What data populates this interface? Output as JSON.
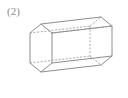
{
  "figure": {
    "label": "(2)",
    "shape_name": "hexagonal-prism",
    "projection": "oblique",
    "colors": {
      "background": "#ffffff",
      "visible_edge": "#8d8d8d",
      "hidden_edge": "#a9a9a9",
      "label_text": "#8a8a8a"
    },
    "geometry": {
      "front_hexagon": {
        "description": "near hexagonal face, left side of drawing",
        "points": "41,24 30,33 30,63 41,72 52,63 52,33"
      },
      "back_hexagon": {
        "description": "far hexagonal face, right side of drawing, offset up-right",
        "points": "101,17 90,26 90,56 101,65 112,56 112,26"
      },
      "connector_edges": [
        "41,24 101,17",
        "30,33 90,26",
        "30,63 90,56",
        "41,72 101,65",
        "52,63 112,56",
        "52,33 112,26"
      ],
      "visible_edges": [
        "30,33 41,24",
        "41,24 52,33",
        "30,33 30,63",
        "30,63 41,72",
        "41,72 52,63",
        "52,63 52,33",
        "41,24 101,17",
        "101,17 112,26",
        "112,26 112,56",
        "112,56 101,65",
        "101,65 90,56",
        "90,56 90,26",
        "30,33 90,26",
        "30,63 90,56",
        "41,72 101,65",
        "52,33 112,26",
        "52,63 112,56"
      ],
      "hidden_edges": [
        "30,33 90,26",
        "30,63 90,56",
        "90,26 90,56",
        "90,26 101,17",
        "90,56 101,65",
        "52,33 112,26"
      ]
    }
  }
}
